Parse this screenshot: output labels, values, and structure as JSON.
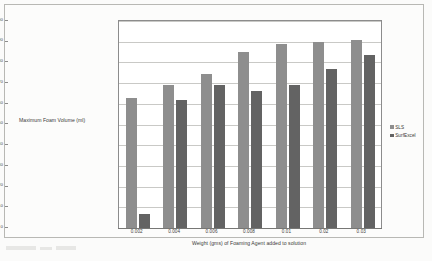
{
  "chart_data": {
    "type": "bar",
    "title": "",
    "xlabel": "Weight (gms) of Foaming Agent added to solution",
    "ylabel": "Maximum Foam Volume (ml)",
    "categories": [
      "0.002",
      "0.004",
      "0.006",
      "0.008",
      "0.01",
      "0.02",
      "0.03"
    ],
    "series": [
      {
        "name": "SLS",
        "color": "#8e8e8e",
        "values": [
          63,
          69,
          74.5,
          85,
          89,
          90,
          91
        ]
      },
      {
        "name": "SurfExcel",
        "color": "#636363",
        "values": [
          7,
          62,
          69,
          66,
          69,
          77,
          83.5
        ]
      }
    ],
    "ylim": [
      0,
      100
    ],
    "ytick_step": 10,
    "yticks": [
      "0",
      "10",
      "20",
      "30",
      "40",
      "50",
      "60",
      "70",
      "80",
      "90",
      "100"
    ],
    "grid": true,
    "legend_position": "right"
  },
  "legend": {
    "marker": "square-marker"
  }
}
